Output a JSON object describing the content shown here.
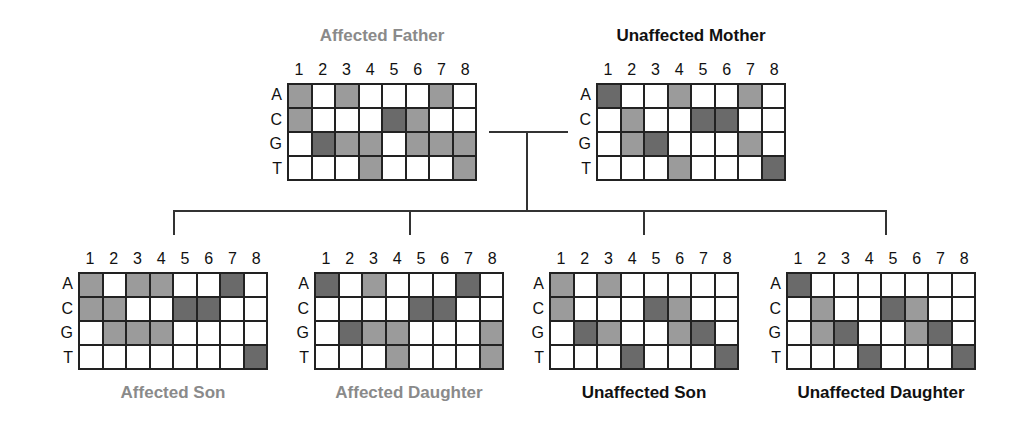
{
  "colors": {
    "light_fill": "#9b9b9b",
    "dark_fill": "#6a6a6a",
    "empty_fill": "#ffffff",
    "affected_label": "#8a8a8a",
    "unaffected_label": "#111111"
  },
  "column_labels": [
    "1",
    "2",
    "3",
    "4",
    "5",
    "6",
    "7",
    "8"
  ],
  "row_labels": [
    "A",
    "C",
    "G",
    "T"
  ],
  "legend_note": "Cell shading: 0 = white, 1 = light gray, 2 = dark gray",
  "parents": [
    {
      "id": "father",
      "label": "Affected Father",
      "status": "affected",
      "grid": [
        [
          1,
          0,
          1,
          0,
          0,
          0,
          1,
          0
        ],
        [
          1,
          0,
          0,
          0,
          2,
          1,
          0,
          0
        ],
        [
          0,
          2,
          1,
          1,
          0,
          1,
          1,
          1
        ],
        [
          0,
          0,
          0,
          1,
          0,
          0,
          0,
          1
        ]
      ]
    },
    {
      "id": "mother",
      "label": "Unaffected Mother",
      "status": "unaffected",
      "grid": [
        [
          2,
          0,
          0,
          1,
          0,
          0,
          1,
          0
        ],
        [
          0,
          1,
          0,
          0,
          2,
          2,
          0,
          0
        ],
        [
          0,
          1,
          2,
          0,
          0,
          0,
          1,
          0
        ],
        [
          0,
          0,
          0,
          1,
          0,
          0,
          0,
          2
        ]
      ]
    }
  ],
  "children": [
    {
      "id": "affected-son",
      "label": "Affected Son",
      "status": "affected",
      "grid": [
        [
          1,
          0,
          1,
          1,
          0,
          0,
          2,
          0
        ],
        [
          1,
          1,
          0,
          0,
          2,
          2,
          0,
          0
        ],
        [
          0,
          1,
          1,
          1,
          0,
          0,
          0,
          0
        ],
        [
          0,
          0,
          0,
          0,
          0,
          0,
          0,
          2
        ]
      ]
    },
    {
      "id": "affected-daughter",
      "label": "Affected Daughter",
      "status": "affected",
      "grid": [
        [
          2,
          0,
          1,
          0,
          0,
          0,
          2,
          0
        ],
        [
          0,
          0,
          0,
          0,
          2,
          2,
          0,
          0
        ],
        [
          0,
          2,
          1,
          1,
          0,
          0,
          0,
          1
        ],
        [
          0,
          0,
          0,
          1,
          0,
          0,
          0,
          1
        ]
      ]
    },
    {
      "id": "unaffected-son",
      "label": "Unaffected Son",
      "status": "unaffected",
      "grid": [
        [
          1,
          0,
          1,
          0,
          0,
          0,
          0,
          0
        ],
        [
          1,
          0,
          0,
          0,
          2,
          1,
          0,
          0
        ],
        [
          0,
          2,
          1,
          0,
          0,
          1,
          2,
          0
        ],
        [
          0,
          0,
          0,
          2,
          0,
          0,
          0,
          2
        ]
      ]
    },
    {
      "id": "unaffected-daughter",
      "label": "Unaffected Daughter",
      "status": "unaffected",
      "grid": [
        [
          2,
          0,
          0,
          0,
          0,
          0,
          0,
          0
        ],
        [
          0,
          1,
          0,
          0,
          2,
          1,
          0,
          0
        ],
        [
          0,
          1,
          2,
          0,
          0,
          1,
          2,
          0
        ],
        [
          0,
          0,
          0,
          2,
          0,
          0,
          0,
          2
        ]
      ]
    }
  ]
}
